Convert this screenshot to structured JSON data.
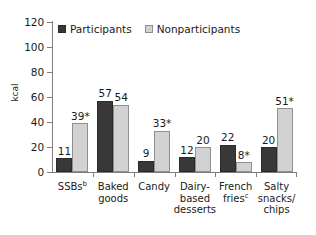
{
  "chart_data": {
    "type": "bar",
    "title": "",
    "xlabel": "",
    "ylabel": "kcal",
    "ylim": [
      0,
      120
    ],
    "ytick_values": [
      0,
      20,
      40,
      60,
      80,
      100,
      120
    ],
    "ytick_labels": [
      "0",
      "20",
      "40",
      "60",
      "80",
      "100",
      "120"
    ],
    "grid": false,
    "legend_position": "top-left",
    "categories": [
      "SSBs",
      "Baked goods",
      "Candy",
      "Dairy-based desserts",
      "French fries",
      "Salty snacks/chips"
    ],
    "category_labels": [
      {
        "text": "SSBs",
        "superscript": "b",
        "lines": [
          "SSBs"
        ]
      },
      {
        "text": "Baked goods",
        "superscript": "",
        "lines": [
          "Baked",
          "goods"
        ]
      },
      {
        "text": "Candy",
        "superscript": "",
        "lines": [
          "Candy"
        ]
      },
      {
        "text": "Dairy-based desserts",
        "superscript": "",
        "lines": [
          "Dairy-",
          "based",
          "desserts"
        ]
      },
      {
        "text": "French fries",
        "superscript": "c",
        "lines": [
          "French",
          "fries"
        ]
      },
      {
        "text": "Salty snacks/chips",
        "superscript": "",
        "lines": [
          "Salty",
          "snacks/",
          "chips"
        ]
      }
    ],
    "series": [
      {
        "name": "Participants",
        "color": "#383838",
        "values": [
          11,
          57,
          9,
          12,
          22,
          20
        ],
        "data_labels": [
          "11",
          "57",
          "9",
          "12",
          "22",
          "20"
        ]
      },
      {
        "name": "Nonparticipants",
        "color": "#d2d2d2",
        "values": [
          39,
          54,
          33,
          20,
          8,
          51
        ],
        "data_labels": [
          "39*",
          "54",
          "33*",
          "20",
          "8*",
          "51*"
        ]
      }
    ],
    "annotations": [
      "* indicates statistically significant difference"
    ]
  },
  "legend": {
    "items": [
      {
        "label": "Participants",
        "swatch": "participants"
      },
      {
        "label": "Nonparticipants",
        "swatch": "nonparticipants"
      }
    ]
  },
  "axes": {
    "y_title": "kcal"
  }
}
